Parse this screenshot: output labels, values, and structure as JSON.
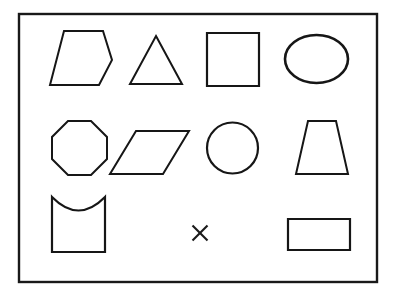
{
  "figure": {
    "background_color": "#ffffff",
    "stroke_color": "#161616",
    "frame": {
      "name": "outer-rectangle-border",
      "label": "Border frame",
      "x": 19,
      "y": 14,
      "width": 358,
      "height": 268,
      "stroke_width": 2.4
    },
    "marker": {
      "name": "x-mark",
      "label": "X",
      "center_x": 200,
      "center_y": 233,
      "size": 15,
      "stroke_width": 2.1
    },
    "rows": [
      {
        "row_index": 1,
        "shapes": [
          {
            "name": "pentagon",
            "label": "Pentagon",
            "kind": "polygon",
            "points": "64,31 103,31 112,60 99,85 50,85",
            "stroke_width": 2.0
          },
          {
            "name": "triangle",
            "label": "Triangle",
            "kind": "polygon",
            "points": "156,36 182,84 130,84",
            "stroke_width": 2.0
          },
          {
            "name": "square",
            "label": "Square",
            "kind": "polygon",
            "points": "207,33 259,33 259,86 207,86",
            "stroke_width": 2.2
          },
          {
            "name": "ellipse",
            "label": "Ellipse",
            "kind": "ellipse",
            "cx": 316.5,
            "cy": 59,
            "rx": 31.5,
            "ry": 24,
            "stroke_width": 2.6
          }
        ]
      },
      {
        "row_index": 2,
        "shapes": [
          {
            "name": "octagon",
            "label": "Octagon",
            "kind": "polygon",
            "points": "68,121 91,121 107,137 107,159 91,175 68,175 52,159 52,137",
            "stroke_width": 2.0
          },
          {
            "name": "parallelogram",
            "label": "Parallelogram",
            "kind": "polygon",
            "points": "136,131 189,131 163,174 110,174",
            "stroke_width": 2.0
          },
          {
            "name": "circle",
            "label": "Circle",
            "kind": "circle",
            "cx": 232.5,
            "cy": 148,
            "r": 25.5,
            "stroke_width": 2.2
          },
          {
            "name": "trapezoid",
            "label": "Trapezoid",
            "kind": "polygon",
            "points": "308,121 336,121 348,174 296,174",
            "stroke_width": 2.0
          }
        ]
      },
      {
        "row_index": 3,
        "shapes": [
          {
            "name": "concave-top-square",
            "label": "Square with concave top",
            "kind": "path",
            "d": "M 52,197 L 52,252 L 105,252 L 105,197 Q 78.5,224 52,197 Z",
            "stroke_width": 2.2
          },
          {
            "name": "rectangle",
            "label": "Rectangle",
            "kind": "polygon",
            "points": "288,219 350,219 350,250 288,250",
            "stroke_width": 2.2
          }
        ]
      }
    ]
  }
}
